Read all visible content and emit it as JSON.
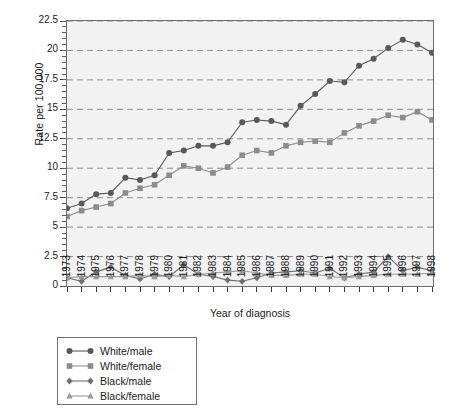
{
  "chart_data": {
    "type": "line",
    "title": "",
    "xlabel": "Year of diagnosis",
    "ylabel": "Rate per 100,000",
    "xlim": [
      1973,
      1998
    ],
    "ylim": [
      0,
      22.5
    ],
    "yticks": [
      0,
      2.5,
      5,
      7.5,
      10,
      12.5,
      15,
      17.5,
      20,
      22.5
    ],
    "ytick_labels": [
      "0",
      "2.5",
      "5",
      "7.5",
      "10",
      "12.5",
      "15",
      "17.5",
      "20",
      "22.5"
    ],
    "grid": "horizontal-dashed",
    "legend_position": "below-left",
    "categories": [
      "1973",
      "1974",
      "1975",
      "1976",
      "1977",
      "1978",
      "1979",
      "1980",
      "1981",
      "1982",
      "1983",
      "1984",
      "1985",
      "1986",
      "1987",
      "1988",
      "1989",
      "1990",
      "1991",
      "1992",
      "1993",
      "1994",
      "1995",
      "1996",
      "1997",
      "1998"
    ],
    "series": [
      {
        "name": "White/male",
        "marker": "circle",
        "color": "#595959",
        "values": [
          6.6,
          7.0,
          7.8,
          7.9,
          9.2,
          9.0,
          9.4,
          11.3,
          11.5,
          11.9,
          11.9,
          12.2,
          13.9,
          14.1,
          14.0,
          13.7,
          15.3,
          16.3,
          17.4,
          17.3,
          18.7,
          19.3,
          20.2,
          20.9,
          20.5,
          19.8
        ]
      },
      {
        "name": "White/female",
        "marker": "square",
        "color": "#8c8c8c",
        "values": [
          5.9,
          6.4,
          6.7,
          7.0,
          7.9,
          8.3,
          8.6,
          9.4,
          10.2,
          10.0,
          9.6,
          10.1,
          11.1,
          11.5,
          11.3,
          11.9,
          12.2,
          12.3,
          12.2,
          13.0,
          13.6,
          14.0,
          14.5,
          14.3,
          14.8,
          14.1
        ]
      },
      {
        "name": "Black/male",
        "marker": "diamond",
        "color": "#707070",
        "values": [
          0.7,
          0.4,
          1.2,
          1.6,
          0.9,
          0.6,
          1.0,
          0.8,
          1.8,
          1.0,
          0.8,
          0.5,
          0.4,
          0.7,
          1.1,
          1.2,
          1.3,
          1.1,
          1.5,
          0.7,
          1.0,
          1.2,
          2.5,
          1.3,
          1.6,
          1.3
        ]
      },
      {
        "name": "Black/female",
        "marker": "triangle",
        "color": "#9a9a9a",
        "values": [
          0.7,
          0.8,
          0.8,
          0.8,
          0.8,
          0.9,
          0.8,
          0.9,
          0.8,
          1.0,
          1.1,
          1.2,
          1.3,
          1.1,
          0.9,
          0.9,
          1.0,
          1.0,
          0.8,
          0.7,
          0.8,
          0.9,
          1.0,
          1.0,
          1.0,
          1.1
        ]
      }
    ]
  },
  "legend": {
    "items": [
      {
        "label": "White/male"
      },
      {
        "label": "White/female"
      },
      {
        "label": "Black/male"
      },
      {
        "label": "Black/female"
      }
    ]
  }
}
